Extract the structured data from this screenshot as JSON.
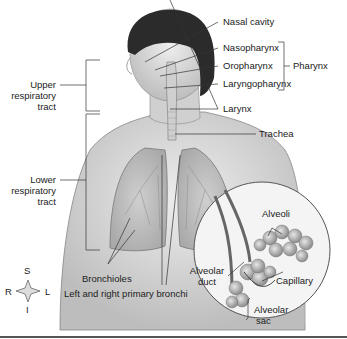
{
  "figure": {
    "labels": {
      "nasal_cavity": "Nasal cavity",
      "nasopharynx": "Nasopharynx",
      "oropharynx": "Oropharynx",
      "laryngopharynx": "Laryngopharynx",
      "pharynx": "Pharynx",
      "larynx": "Larynx",
      "trachea": "Trachea",
      "upper_tract_1": "Upper",
      "upper_tract_2": "respiratory",
      "upper_tract_3": "tract",
      "lower_tract_1": "Lower",
      "lower_tract_2": "respiratory",
      "lower_tract_3": "tract",
      "bronchioles": "Bronchioles",
      "primary_bronchi": "Left and right primary bronchi",
      "alveoli": "Alveoli",
      "alveolar_duct_1": "Alveolar",
      "alveolar_duct_2": "duct",
      "capillary": "Capillary",
      "alveolar_sac_1": "Alveolar",
      "alveolar_sac_2": "sac"
    },
    "compass": {
      "superior": "S",
      "inferior": "I",
      "right": "R",
      "left": "L"
    },
    "colors": {
      "line": "#333333",
      "skin": "#d9d9d9",
      "hair": "#2b2b2b",
      "lung": "#bdbdbd",
      "bottom_rule": "#555555"
    }
  }
}
